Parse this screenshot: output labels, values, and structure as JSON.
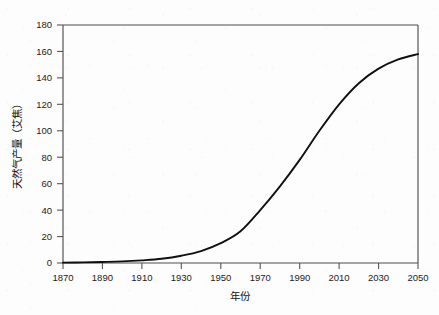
{
  "chart_data": {
    "type": "line",
    "title": "",
    "subtitle": "",
    "xlabel": "年份",
    "ylabel": "天然气产量（艾焦）",
    "xlim": [
      1870,
      2050
    ],
    "ylim": [
      0,
      180
    ],
    "xticks": [
      1870,
      1890,
      1910,
      1930,
      1950,
      1970,
      1990,
      2010,
      2030,
      2050
    ],
    "yticks": [
      0,
      20,
      40,
      60,
      80,
      100,
      120,
      140,
      160,
      180
    ],
    "xtick_labels": [
      "1870",
      "1890",
      "1910",
      "1930",
      "1950",
      "1970",
      "1990",
      "2010",
      "2030",
      "2050"
    ],
    "ytick_labels": [
      "0",
      "20",
      "40",
      "60",
      "80",
      "100",
      "120",
      "140",
      "160",
      "180"
    ],
    "grid": false,
    "legend": false,
    "legend_position": "none",
    "line_color": "#101010",
    "axis_color": "#4e4e4e",
    "background_color": "#fdfdfd",
    "series": [
      {
        "name": "天然气产量",
        "x": [
          1870,
          1880,
          1890,
          1900,
          1910,
          1920,
          1930,
          1940,
          1950,
          1960,
          1970,
          1980,
          1990,
          2000,
          2010,
          2020,
          2030,
          2040,
          2050
        ],
        "values": [
          0.3,
          0.5,
          0.8,
          1.2,
          2.0,
          3.2,
          5.5,
          9.0,
          15.0,
          24.0,
          40.0,
          58.0,
          78.0,
          100.0,
          120.0,
          136.0,
          147.0,
          154.0,
          158.0
        ]
      }
    ],
    "annotations": []
  }
}
